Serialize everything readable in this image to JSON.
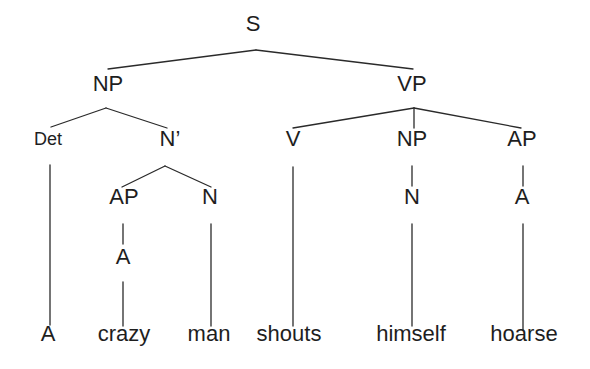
{
  "diagram": {
    "title": "",
    "type": "syntax-tree",
    "sentence": "A crazy man shouts himself hoarse",
    "label_color": "#1e1e1e",
    "line_color": "#2a2a2a",
    "nodes": [
      {
        "id": "S",
        "label": "S",
        "x": 253,
        "y": 25,
        "size": 22,
        "kind": "category"
      },
      {
        "id": "NP1",
        "label": "NP",
        "x": 108,
        "y": 85,
        "size": 22,
        "kind": "category"
      },
      {
        "id": "VP",
        "label": "VP",
        "x": 412,
        "y": 85,
        "size": 22,
        "kind": "category"
      },
      {
        "id": "Det",
        "label": "Det",
        "x": 48,
        "y": 140,
        "size": 18,
        "kind": "category"
      },
      {
        "id": "Nbar",
        "label": "N’",
        "x": 170,
        "y": 140,
        "size": 22,
        "kind": "category"
      },
      {
        "id": "V",
        "label": "V",
        "x": 293,
        "y": 140,
        "size": 22,
        "kind": "category"
      },
      {
        "id": "NP2",
        "label": "NP",
        "x": 412,
        "y": 140,
        "size": 22,
        "kind": "category"
      },
      {
        "id": "AP2",
        "label": "AP",
        "x": 522,
        "y": 140,
        "size": 22,
        "kind": "category"
      },
      {
        "id": "AP1",
        "label": "AP",
        "x": 124,
        "y": 198,
        "size": 22,
        "kind": "category"
      },
      {
        "id": "N1",
        "label": "N",
        "x": 210,
        "y": 198,
        "size": 22,
        "kind": "category"
      },
      {
        "id": "N2",
        "label": "N",
        "x": 412,
        "y": 198,
        "size": 22,
        "kind": "category"
      },
      {
        "id": "A2",
        "label": "A",
        "x": 522,
        "y": 198,
        "size": 22,
        "kind": "category"
      },
      {
        "id": "A1",
        "label": "A",
        "x": 123,
        "y": 258,
        "size": 22,
        "kind": "category"
      },
      {
        "id": "w_A",
        "label": "A",
        "x": 48,
        "y": 335,
        "size": 22,
        "kind": "word"
      },
      {
        "id": "w_crazy",
        "label": "crazy",
        "x": 124,
        "y": 335,
        "size": 22,
        "kind": "word"
      },
      {
        "id": "w_man",
        "label": "man",
        "x": 209,
        "y": 335,
        "size": 22,
        "kind": "word"
      },
      {
        "id": "w_shouts",
        "label": "shouts",
        "x": 289,
        "y": 335,
        "size": 22,
        "kind": "word"
      },
      {
        "id": "w_himself",
        "label": "himself",
        "x": 411,
        "y": 335,
        "size": 22,
        "kind": "word"
      },
      {
        "id": "w_hoarse",
        "label": "hoarse",
        "x": 524,
        "y": 335,
        "size": 22,
        "kind": "word"
      }
    ],
    "edges": [
      {
        "from": "S",
        "to": "NP1",
        "x1": 256,
        "y1": 50,
        "x2": 108,
        "y2": 69
      },
      {
        "from": "S",
        "to": "VP",
        "x1": 256,
        "y1": 50,
        "x2": 413,
        "y2": 69
      },
      {
        "from": "NP1",
        "to": "Det",
        "x1": 106,
        "y1": 108,
        "x2": 51,
        "y2": 127
      },
      {
        "from": "NP1",
        "to": "Nbar",
        "x1": 106,
        "y1": 108,
        "x2": 167,
        "y2": 128
      },
      {
        "from": "VP",
        "to": "V",
        "x1": 414,
        "y1": 108,
        "x2": 293,
        "y2": 128
      },
      {
        "from": "VP",
        "to": "NP2",
        "x1": 414,
        "y1": 108,
        "x2": 414,
        "y2": 128
      },
      {
        "from": "VP",
        "to": "AP2",
        "x1": 414,
        "y1": 108,
        "x2": 521,
        "y2": 128
      },
      {
        "from": "Nbar",
        "to": "AP1",
        "x1": 165,
        "y1": 166,
        "x2": 122,
        "y2": 187
      },
      {
        "from": "Nbar",
        "to": "N1",
        "x1": 165,
        "y1": 166,
        "x2": 211,
        "y2": 187
      },
      {
        "from": "Det",
        "to": "w_A",
        "x1": 50,
        "y1": 165,
        "x2": 50,
        "y2": 325
      },
      {
        "from": "AP1",
        "to": "A1",
        "x1": 123,
        "y1": 224,
        "x2": 123,
        "y2": 244
      },
      {
        "from": "A1",
        "to": "w_crazy",
        "x1": 123,
        "y1": 282,
        "x2": 123,
        "y2": 326
      },
      {
        "from": "N1",
        "to": "w_man",
        "x1": 211,
        "y1": 224,
        "x2": 211,
        "y2": 326
      },
      {
        "from": "V",
        "to": "w_shouts",
        "x1": 293,
        "y1": 167,
        "x2": 293,
        "y2": 326
      },
      {
        "from": "NP2",
        "to": "N2",
        "x1": 412,
        "y1": 166,
        "x2": 412,
        "y2": 186
      },
      {
        "from": "N2",
        "to": "w_himself",
        "x1": 412,
        "y1": 224,
        "x2": 412,
        "y2": 326
      },
      {
        "from": "AP2",
        "to": "A2",
        "x1": 523,
        "y1": 166,
        "x2": 523,
        "y2": 186
      },
      {
        "from": "A2",
        "to": "w_hoarse",
        "x1": 523,
        "y1": 224,
        "x2": 523,
        "y2": 330
      }
    ]
  }
}
